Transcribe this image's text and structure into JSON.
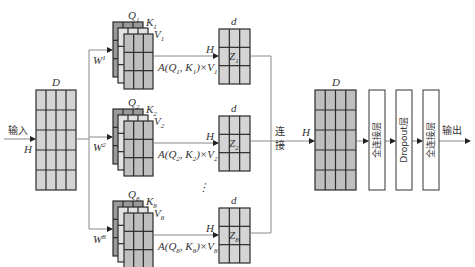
{
  "input": {
    "label": "输入",
    "dim_d": "D",
    "dim_h": "H"
  },
  "heads": [
    {
      "weight": "W",
      "weight_sup": "1",
      "q": "Q",
      "k": "K",
      "v": "V",
      "idx": "1",
      "formula_pre": "A(Q",
      "formula_mid": ", K",
      "formula_post": ")×V",
      "z": "Z",
      "dim_d": "d",
      "dim_h": "H"
    },
    {
      "weight": "W",
      "weight_sup": "2",
      "q": "Q",
      "k": "K",
      "v": "V",
      "idx": "2",
      "formula_pre": "A(Q",
      "formula_mid": ", K",
      "formula_post": ")×V",
      "z": "Z",
      "dim_d": "d",
      "dim_h": "H"
    },
    {
      "weight": "W",
      "weight_sup": "8",
      "q": "Q",
      "k": "K",
      "v": "V",
      "idx": "8",
      "formula_pre": "A(Q",
      "formula_mid": ", K",
      "formula_post": ")×V",
      "z": "Z",
      "dim_d": "d",
      "dim_h": "H"
    }
  ],
  "ellipsis": "⋮",
  "concat": {
    "label_line1": "连",
    "label_line2": "接",
    "dim_d": "D",
    "dim_h": "H"
  },
  "layers": [
    "全连接层",
    "Dropout层",
    "全连接层"
  ],
  "output": {
    "label": "输出"
  },
  "colors": {
    "light_cell": "#d4d4d4",
    "mid_cell": "#bfbfbf",
    "dark_cell": "#9a9a9a",
    "grid": "#2a2a2a",
    "line": "#8a8a8a"
  }
}
